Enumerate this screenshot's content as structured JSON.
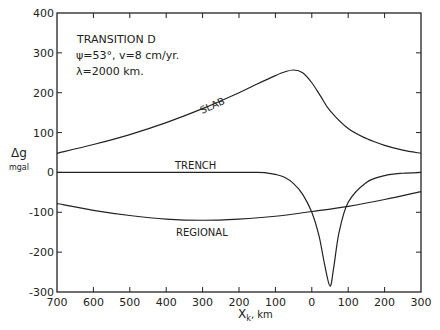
{
  "chart_data": {
    "type": "line",
    "title": "TRANSITION D",
    "annotations": [
      "TRANSITION D",
      "ψ=53°, v=8 cm/yr.",
      "λ=2000 km."
    ],
    "xlabel": "X_k , km",
    "ylabel": "Δg",
    "ylabel_unit": "mgal",
    "xlim": [
      -700,
      300
    ],
    "ylim": [
      -300,
      400
    ],
    "x_tick_labels": [
      "700",
      "600",
      "500",
      "400",
      "300",
      "200",
      "100",
      "0",
      "100",
      "200",
      "300"
    ],
    "x_tick_values": [
      -700,
      -600,
      -500,
      -400,
      -300,
      -200,
      -100,
      0,
      100,
      200,
      300
    ],
    "y_tick_labels": [
      "400",
      "300",
      "200",
      "100",
      "0",
      "-100",
      "-200",
      "-300"
    ],
    "y_tick_values": [
      400,
      300,
      200,
      100,
      0,
      -100,
      -200,
      -300
    ],
    "grid": false,
    "legend": "inline curve labels",
    "series": [
      {
        "name": "SLAB",
        "x": [
          -700,
          -600,
          -500,
          -400,
          -300,
          -200,
          -150,
          -100,
          -75,
          -50,
          -25,
          0,
          25,
          50,
          100,
          150,
          200,
          250,
          300
        ],
        "y": [
          48,
          70,
          95,
          125,
          160,
          200,
          222,
          243,
          252,
          257,
          250,
          225,
          190,
          155,
          110,
          85,
          68,
          56,
          48
        ]
      },
      {
        "name": "TRENCH",
        "x": [
          -700,
          -500,
          -300,
          -150,
          -125,
          -100,
          -75,
          -50,
          -25,
          0,
          20,
          35,
          50,
          60,
          75,
          100,
          150,
          200,
          250,
          300
        ],
        "y": [
          0,
          0,
          0,
          0,
          -1,
          -5,
          -12,
          -28,
          -55,
          -100,
          -160,
          -230,
          -285,
          -240,
          -150,
          -75,
          -25,
          -8,
          -2,
          0
        ]
      },
      {
        "name": "REGIONAL",
        "x": [
          -700,
          -600,
          -500,
          -400,
          -300,
          -200,
          -100,
          0,
          100,
          200,
          300
        ],
        "y": [
          -78,
          -95,
          -108,
          -117,
          -120,
          -117,
          -110,
          -98,
          -85,
          -68,
          -48
        ]
      }
    ]
  },
  "labels": {
    "title": "TRANSITION D",
    "params1": "ψ=53°, v=8 cm/yr.",
    "params2": "λ=2000 km.",
    "ylabel": "Δg",
    "yunit": "mgal",
    "xlabel": "X",
    "xsub": "k",
    "xunit": ", km",
    "slab": "SLAB",
    "trench": "TRENCH",
    "regional": "REGIONAL"
  }
}
